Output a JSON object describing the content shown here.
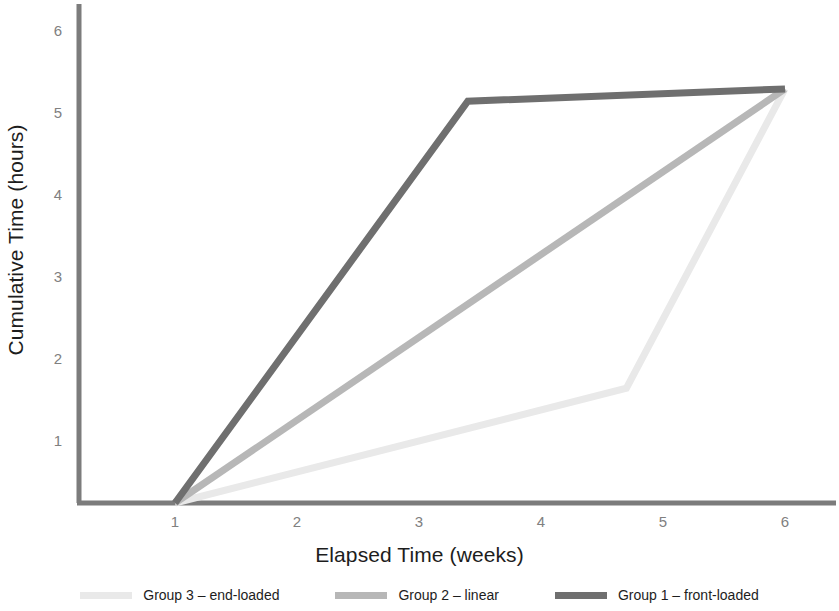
{
  "chart_data": {
    "type": "line",
    "title": "",
    "xlabel": "Elapsed Time (weeks)",
    "ylabel": "Cumulative Time (hours)",
    "xlim": [
      0.55,
      6.4
    ],
    "ylim": [
      0,
      6.35
    ],
    "xticks": [
      1,
      2,
      3,
      4,
      5,
      6
    ],
    "yticks": [
      1,
      2,
      3,
      4,
      5,
      6
    ],
    "xtick_labels": [
      "1",
      "2",
      "3",
      "4",
      "5",
      "6"
    ],
    "ytick_labels": [
      "1",
      "2",
      "3",
      "4",
      "5",
      "6"
    ],
    "grid": false,
    "legend_position": "bottom",
    "series": [
      {
        "name": "Group 3 – end-loaded",
        "color": "#e9e9e9",
        "x": [
          1,
          4.7,
          6
        ],
        "y": [
          0,
          1.4,
          5.05
        ]
      },
      {
        "name": "Group 2 – linear",
        "color": "#b7b7b7",
        "x": [
          1,
          6
        ],
        "y": [
          0,
          5.05
        ]
      },
      {
        "name": "Group 1 – front-loaded",
        "color": "#6f6f6f",
        "x": [
          1,
          3.4,
          6
        ],
        "y": [
          0,
          4.9,
          5.05
        ]
      }
    ]
  },
  "legend": {
    "items": [
      {
        "label": "Group 3 – end-loaded",
        "color": "#e9e9e9"
      },
      {
        "label": "Group 2 – linear",
        "color": "#b7b7b7"
      },
      {
        "label": "Group 1 – front-loaded",
        "color": "#6f6f6f"
      }
    ]
  },
  "axes": {
    "line_color": "#7c7c7c",
    "tick_label_color": "#808080",
    "title_color": "#1d1d1d"
  }
}
